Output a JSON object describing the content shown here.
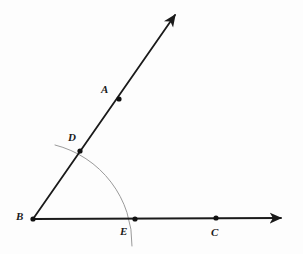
{
  "figure": {
    "kind": "geometry-diagram",
    "background_color": "#fdfdfd",
    "ray_color": "#1a1a1a",
    "arc_color": "#9a9a9a",
    "point_color": "#111111",
    "label_color": "#1a1a1a",
    "ray_width": 1.8,
    "arc_width": 1.0,
    "point_radius": 2.6
  },
  "points": [
    {
      "name": "A",
      "label": "A",
      "x": 119,
      "y": 99,
      "label_x": 101,
      "label_y": 84,
      "dot": true
    },
    {
      "name": "B",
      "label": "B",
      "x": 33,
      "y": 219,
      "label_x": 16,
      "label_y": 211,
      "dot": true
    },
    {
      "name": "C",
      "label": "C",
      "x": 216,
      "y": 218,
      "label_x": 211,
      "label_y": 227,
      "dot": true
    },
    {
      "name": "D",
      "label": "D",
      "x": 80,
      "y": 151,
      "label_x": 68,
      "label_y": 132,
      "dot": true
    },
    {
      "name": "E",
      "label": "E",
      "x": 135,
      "y": 219,
      "label_x": 120,
      "label_y": 226,
      "dot": true
    }
  ],
  "rays": [
    {
      "name": "ray-BA",
      "from": "B",
      "x1": 33,
      "y1": 219,
      "x2": 175,
      "y2": 15,
      "arrow_at_end": true
    },
    {
      "name": "ray-BC",
      "from": "B",
      "x1": 33,
      "y1": 219,
      "x2": 281,
      "y2": 218,
      "arrow_at_end": true
    }
  ],
  "arc": {
    "name": "construction-arc",
    "center_x": 33,
    "center_y": 219,
    "radius": 102,
    "start_x": 55,
    "start_y": 145,
    "end_x": 132,
    "end_y": 246,
    "passes_through": [
      "D",
      "E"
    ]
  },
  "arrowheads": [
    {
      "name": "arrowhead-ray-BA",
      "tip_x": 175,
      "tip_y": 15
    },
    {
      "name": "arrowhead-ray-BC",
      "tip_x": 281,
      "tip_y": 218
    }
  ]
}
